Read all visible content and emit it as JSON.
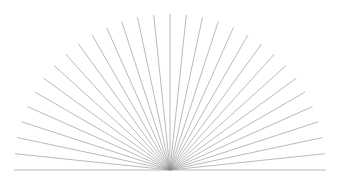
{
  "figure": {
    "name": "radial-fan-sunburst",
    "width": 342,
    "height": 189,
    "background_color": "#ffffff"
  },
  "chart_data": {
    "type": "line",
    "title": "",
    "subtitle": "",
    "xlabel": "",
    "ylabel": "",
    "grid": false,
    "legend": null,
    "center": {
      "x": 170,
      "y": 170
    },
    "radius": 156,
    "ray_count": 31,
    "angle_start_deg": 180,
    "angle_end_deg": 0,
    "angle_step_deg": 6,
    "stroke_color": "#8c8c8c",
    "stroke_width": 0.6,
    "xlim": [
      0,
      342
    ],
    "ylim": [
      0,
      189
    ],
    "rays": [
      {
        "index": 0,
        "angle_deg": 180,
        "x1": 170,
        "y1": 170,
        "x2": 14,
        "y2": 170
      },
      {
        "index": 1,
        "angle_deg": 174,
        "x1": 170,
        "y1": 170,
        "x2": 14.86,
        "y2": 153.69
      },
      {
        "index": 2,
        "angle_deg": 168,
        "x1": 170,
        "y1": 170,
        "x2": 17.41,
        "y2": 137.56
      },
      {
        "index": 3,
        "angle_deg": 162,
        "x1": 170,
        "y1": 170,
        "x2": 21.61,
        "y2": 121.78
      },
      {
        "index": 4,
        "angle_deg": 156,
        "x1": 170,
        "y1": 170,
        "x2": 27.5,
        "y2": 106.55
      },
      {
        "index": 5,
        "angle_deg": 150,
        "x1": 170,
        "y1": 170,
        "x2": 34.89,
        "y2": 92.0
      },
      {
        "index": 6,
        "angle_deg": 144,
        "x1": 170,
        "y1": 170,
        "x2": 43.79,
        "y2": 78.31
      },
      {
        "index": 7,
        "angle_deg": 138,
        "x1": 170,
        "y1": 170,
        "x2": 54.05,
        "y2": 65.61
      },
      {
        "index": 8,
        "angle_deg": 132,
        "x1": 170,
        "y1": 170,
        "x2": 65.61,
        "y2": 54.05
      },
      {
        "index": 9,
        "angle_deg": 126,
        "x1": 170,
        "y1": 170,
        "x2": 78.31,
        "y2": 43.79
      },
      {
        "index": 10,
        "angle_deg": 120,
        "x1": 170,
        "y1": 170,
        "x2": 92.0,
        "y2": 34.89
      },
      {
        "index": 11,
        "angle_deg": 114,
        "x1": 170,
        "y1": 170,
        "x2": 106.55,
        "y2": 27.5
      },
      {
        "index": 12,
        "angle_deg": 108,
        "x1": 170,
        "y1": 170,
        "x2": 121.78,
        "y2": 21.61
      },
      {
        "index": 13,
        "angle_deg": 102,
        "x1": 170,
        "y1": 170,
        "x2": 137.56,
        "y2": 17.41
      },
      {
        "index": 14,
        "angle_deg": 96,
        "x1": 170,
        "y1": 170,
        "x2": 153.69,
        "y2": 14.86
      },
      {
        "index": 15,
        "angle_deg": 90,
        "x1": 170,
        "y1": 170,
        "x2": 170,
        "y2": 14
      },
      {
        "index": 16,
        "angle_deg": 84,
        "x1": 170,
        "y1": 170,
        "x2": 186.31,
        "y2": 14.86
      },
      {
        "index": 17,
        "angle_deg": 78,
        "x1": 170,
        "y1": 170,
        "x2": 202.44,
        "y2": 17.41
      },
      {
        "index": 18,
        "angle_deg": 72,
        "x1": 170,
        "y1": 170,
        "x2": 218.22,
        "y2": 21.61
      },
      {
        "index": 19,
        "angle_deg": 66,
        "x1": 170,
        "y1": 170,
        "x2": 233.45,
        "y2": 27.5
      },
      {
        "index": 20,
        "angle_deg": 60,
        "x1": 170,
        "y1": 170,
        "x2": 248.0,
        "y2": 34.89
      },
      {
        "index": 21,
        "angle_deg": 54,
        "x1": 170,
        "y1": 170,
        "x2": 261.69,
        "y2": 43.79
      },
      {
        "index": 22,
        "angle_deg": 48,
        "x1": 170,
        "y1": 170,
        "x2": 274.39,
        "y2": 54.05
      },
      {
        "index": 23,
        "angle_deg": 42,
        "x1": 170,
        "y1": 170,
        "x2": 285.95,
        "y2": 65.61
      },
      {
        "index": 24,
        "angle_deg": 36,
        "x1": 170,
        "y1": 170,
        "x2": 296.21,
        "y2": 78.31
      },
      {
        "index": 25,
        "angle_deg": 30,
        "x1": 170,
        "y1": 170,
        "x2": 305.11,
        "y2": 92.0
      },
      {
        "index": 26,
        "angle_deg": 24,
        "x1": 170,
        "y1": 170,
        "x2": 312.5,
        "y2": 106.55
      },
      {
        "index": 27,
        "angle_deg": 18,
        "x1": 170,
        "y1": 170,
        "x2": 318.39,
        "y2": 121.78
      },
      {
        "index": 28,
        "angle_deg": 12,
        "x1": 170,
        "y1": 170,
        "x2": 322.59,
        "y2": 137.56
      },
      {
        "index": 29,
        "angle_deg": 6,
        "x1": 170,
        "y1": 170,
        "x2": 325.14,
        "y2": 153.69
      },
      {
        "index": 30,
        "angle_deg": 0,
        "x1": 170,
        "y1": 170,
        "x2": 326,
        "y2": 170
      }
    ]
  }
}
